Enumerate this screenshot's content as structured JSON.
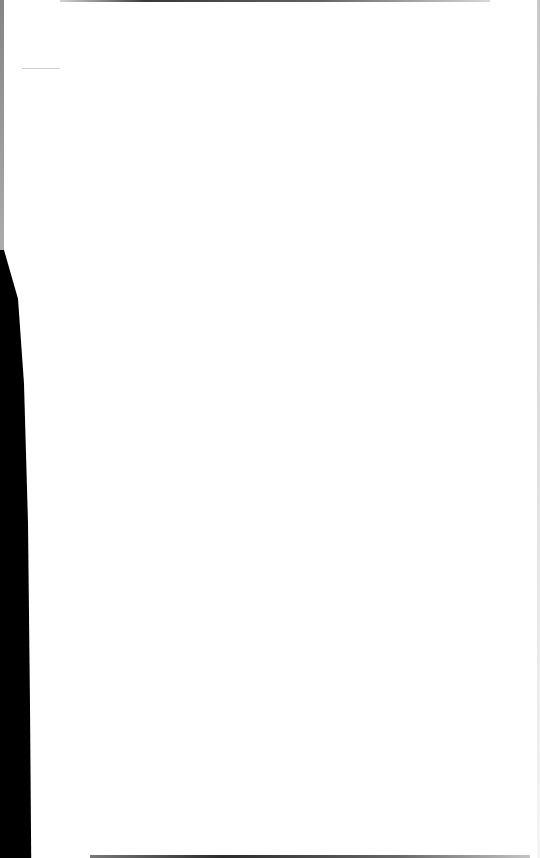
{
  "document": {
    "type": "blank-scanned-page",
    "text_content": "",
    "colors": {
      "paper": "#ffffff",
      "scan_shadow": "#000000"
    }
  }
}
